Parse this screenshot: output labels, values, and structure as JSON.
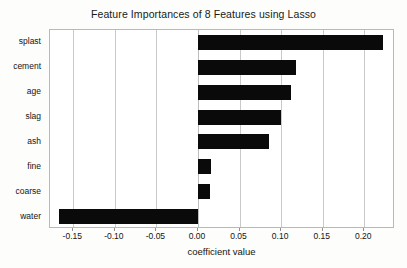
{
  "chart_data": {
    "type": "bar",
    "orientation": "horizontal",
    "title": "Feature Importances of 8 Features using Lasso",
    "xlabel": "coefficient value",
    "ylabel": "",
    "categories": [
      "splast",
      "cement",
      "age",
      "slag",
      "ash",
      "fine",
      "coarse",
      "water"
    ],
    "values": [
      0.222,
      0.118,
      0.112,
      0.1,
      0.086,
      0.016,
      0.014,
      -0.167
    ],
    "series": [
      {
        "name": "coefficient value",
        "values": [
          0.222,
          0.118,
          0.112,
          0.1,
          0.086,
          0.016,
          0.014,
          -0.167
        ]
      }
    ],
    "xlim": [
      -0.178,
      0.237
    ],
    "ylim": [
      -0.5,
      7.5
    ],
    "xticks": [
      -0.15,
      -0.1,
      -0.05,
      0.0,
      0.05,
      0.1,
      0.15,
      0.2
    ],
    "xticklabels": [
      "-0.15",
      "-0.10",
      "-0.05",
      "0.00",
      "0.05",
      "0.10",
      "0.15",
      "0.20"
    ],
    "grid": "vertical",
    "legend": "none",
    "bar_color": "#0a0a0a",
    "grid_color": "#c9c9c9",
    "frame_color": "#b9b9b9",
    "background_color": "#ffffff",
    "page_background_color": "#fdfdfb"
  }
}
